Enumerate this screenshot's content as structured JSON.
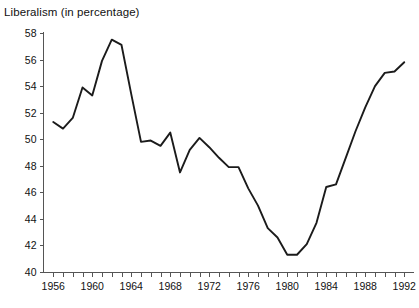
{
  "chart_data": {
    "type": "line",
    "title": "Liberalism (in percentage)",
    "xlabel": "",
    "ylabel": "",
    "grid": false,
    "legend": false,
    "xlim": [
      1955,
      1993
    ],
    "ylim": [
      40,
      58
    ],
    "ytick_labels": [
      "40",
      "42",
      "44",
      "46",
      "48",
      "50",
      "52",
      "54",
      "56",
      "58"
    ],
    "yticks": [
      40,
      42,
      44,
      46,
      48,
      50,
      52,
      54,
      56,
      58
    ],
    "xtick_labels": [
      "1956",
      "1960",
      "1964",
      "1968",
      "1972",
      "1976",
      "1980",
      "1984",
      "1988",
      "1992"
    ],
    "xticks": [
      1956,
      1960,
      1964,
      1968,
      1972,
      1976,
      1980,
      1984,
      1988,
      1992
    ],
    "x_minor_tick_step": 1,
    "x": [
      1956,
      1957,
      1958,
      1959,
      1960,
      1961,
      1962,
      1963,
      1964,
      1965,
      1966,
      1967,
      1968,
      1969,
      1970,
      1971,
      1972,
      1973,
      1974,
      1975,
      1976,
      1977,
      1978,
      1979,
      1980,
      1981,
      1982,
      1983,
      1984,
      1985,
      1986,
      1987,
      1988,
      1989,
      1990,
      1991,
      1992
    ],
    "values": [
      51.3,
      50.8,
      51.6,
      53.9,
      53.3,
      55.9,
      57.5,
      57.1,
      53.4,
      49.8,
      49.9,
      49.5,
      50.5,
      47.5,
      49.2,
      50.1,
      49.4,
      48.6,
      47.9,
      47.9,
      46.3,
      45.0,
      43.3,
      42.6,
      41.3,
      41.3,
      42.1,
      43.7,
      46.4,
      46.6,
      48.6,
      50.6,
      52.4,
      54.0,
      55.0,
      55.1,
      55.8
    ],
    "series_name": "Liberalism",
    "line_color": "#1b1b1b",
    "background_color": "#ffffff"
  }
}
